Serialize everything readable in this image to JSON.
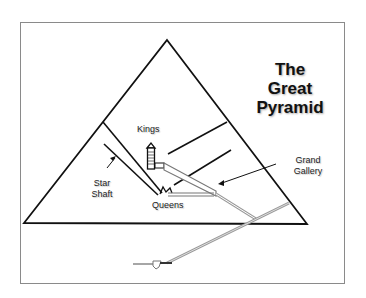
{
  "title": {
    "lines": [
      "The",
      "Great",
      "Pyramid"
    ]
  },
  "labels": {
    "kings": "Kings",
    "queens": "Queens",
    "star_shaft": [
      "Star",
      "Shaft"
    ],
    "grand_gallery": [
      "Grand",
      "Gallery"
    ]
  },
  "colors": {
    "line": "#111111",
    "passage": "#9a9a9a",
    "frame": "#8a8a8a",
    "background": "#ffffff"
  }
}
